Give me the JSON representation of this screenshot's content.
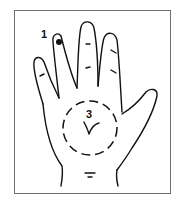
{
  "diagram": {
    "points": [
      {
        "id": "point-1",
        "label": "1",
        "location": "index fingertip",
        "marker": "filled-dot"
      },
      {
        "id": "point-3",
        "label": "3",
        "location": "center of palm",
        "marker": "dashed-circle"
      }
    ],
    "colors": {
      "line": "#111111",
      "frame": "#6e6e6e",
      "background": "#ffffff"
    }
  }
}
